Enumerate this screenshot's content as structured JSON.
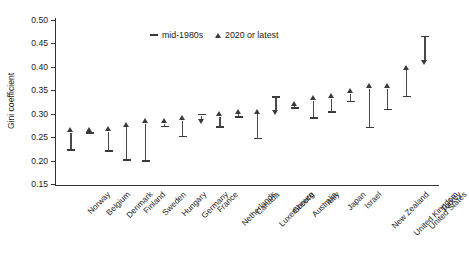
{
  "chart_data": {
    "type": "scatter",
    "title": "",
    "xlabel": "",
    "ylabel": "Gini coefficient",
    "ylim": [
      0.15,
      0.5
    ],
    "ytick_labels": [
      "0.50",
      "0.45",
      "0.40",
      "0.35",
      "0.30",
      "0.25",
      "0.20",
      "0.15"
    ],
    "ytick_values": [
      0.5,
      0.45,
      0.4,
      0.35,
      0.3,
      0.25,
      0.2,
      0.15
    ],
    "grid": false,
    "legend_position": "top-center",
    "legend": [
      {
        "label": "mid-1980s",
        "marker": "dash"
      },
      {
        "label": "2020 or latest",
        "marker": "triangle"
      }
    ],
    "categories": [
      "Norway",
      "Belgium",
      "Denmark",
      "Finland",
      "Sweden",
      "Hungary",
      "Germany",
      "France",
      "Netherlands",
      "Canada",
      "Luxembourg",
      "Greece",
      "Australia",
      "Italy",
      "Japan",
      "Israel",
      "New Zealand",
      "United Kingdom",
      "United States",
      "Turkey"
    ],
    "series": [
      {
        "name": "mid-1980s",
        "values": [
          0.222,
          0.259,
          0.221,
          0.201,
          0.199,
          0.273,
          0.251,
          0.298,
          0.272,
          0.293,
          0.247,
          0.336,
          0.312,
          0.291,
          0.304,
          0.326,
          0.271,
          0.309,
          0.337,
          0.465
        ]
      },
      {
        "name": "2020 or latest",
        "values": [
          0.262,
          0.262,
          0.263,
          0.273,
          0.28,
          0.28,
          0.287,
          0.287,
          0.295,
          0.301,
          0.301,
          0.307,
          0.318,
          0.33,
          0.334,
          0.344,
          0.355,
          0.355,
          0.395,
          0.412
        ]
      }
    ],
    "direction": [
      "up",
      "up",
      "up",
      "up",
      "up",
      "up",
      "up",
      "down",
      "up",
      "up",
      "up",
      "down",
      "up",
      "up",
      "up",
      "up",
      "up",
      "up",
      "up",
      "down"
    ]
  }
}
